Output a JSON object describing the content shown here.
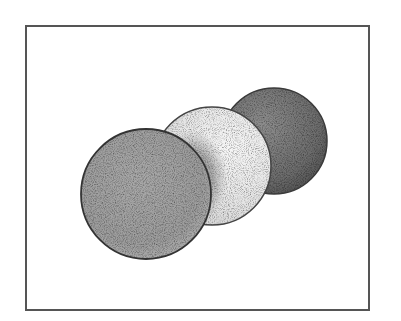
{
  "figure": {
    "description": "Three overlapping stippled spheres inside a rectangular frame",
    "background_color": "#ffffff",
    "frame": {
      "x": 26,
      "y": 26,
      "width": 343,
      "height": 284,
      "stroke_color": "#555555",
      "stroke_width": 2
    },
    "spheres": [
      {
        "name": "back-dark-sphere",
        "cx": 274,
        "cy": 141,
        "r": 53,
        "fill_light": "#8a8a8a",
        "fill_dark": "#555555",
        "outline": "#3a3a3a"
      },
      {
        "name": "middle-light-sphere",
        "cx": 212,
        "cy": 166,
        "r": 59,
        "fill_light": "#f0f0f0",
        "fill_dark": "#d4d4d4",
        "shadow_color": "#555555",
        "outline": "#444444"
      },
      {
        "name": "front-gray-sphere",
        "cx": 146,
        "cy": 194,
        "r": 65,
        "fill_light": "#bdbdbd",
        "fill_dark": "#8f8f8f",
        "outline": "#333333"
      }
    ]
  }
}
